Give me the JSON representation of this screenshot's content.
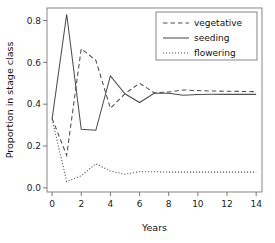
{
  "chart_data": {
    "type": "line",
    "title": "",
    "xlabel": "Years",
    "ylabel": "Proportion in stage class",
    "xlim": [
      -0.35,
      14.4
    ],
    "ylim": [
      -0.02,
      0.86
    ],
    "xticks": [
      0,
      2,
      4,
      6,
      8,
      10,
      12,
      14
    ],
    "xticklabels": [
      "0",
      "2",
      "4",
      "6",
      "8",
      "10",
      "12",
      "14"
    ],
    "yticks": [
      0.0,
      0.2,
      0.4,
      0.6,
      0.8
    ],
    "yticklabels": [
      "0.0",
      "0.2",
      "0.4",
      "0.6",
      "0.8"
    ],
    "grid": false,
    "legend_position": "top-right",
    "x": [
      0,
      1,
      2,
      3,
      4,
      5,
      6,
      7,
      8,
      9,
      10,
      11,
      12,
      13,
      14
    ],
    "series": [
      {
        "name": "vegetative",
        "style": "dashed",
        "color": "#4d4d4d",
        "values": [
          0.332,
          0.155,
          0.665,
          0.61,
          0.38,
          0.45,
          0.5,
          0.455,
          0.458,
          0.468,
          0.465,
          0.463,
          0.462,
          0.461,
          0.46
        ]
      },
      {
        "name": "seeding",
        "style": "solid",
        "color": "#4d4d4d",
        "values": [
          0.33,
          0.83,
          0.28,
          0.275,
          0.535,
          0.45,
          0.408,
          0.452,
          0.452,
          0.443,
          0.446,
          0.447,
          0.447,
          0.447,
          0.447
        ]
      },
      {
        "name": "flowering",
        "style": "dotted",
        "color": "#4d4d4d",
        "values": [
          0.328,
          0.03,
          0.058,
          0.115,
          0.08,
          0.065,
          0.077,
          0.077,
          0.075,
          0.075,
          0.075,
          0.075,
          0.075,
          0.075,
          0.075
        ]
      }
    ]
  },
  "legend": {
    "items": [
      {
        "label": "vegetative"
      },
      {
        "label": "seeding"
      },
      {
        "label": "flowering"
      }
    ]
  }
}
